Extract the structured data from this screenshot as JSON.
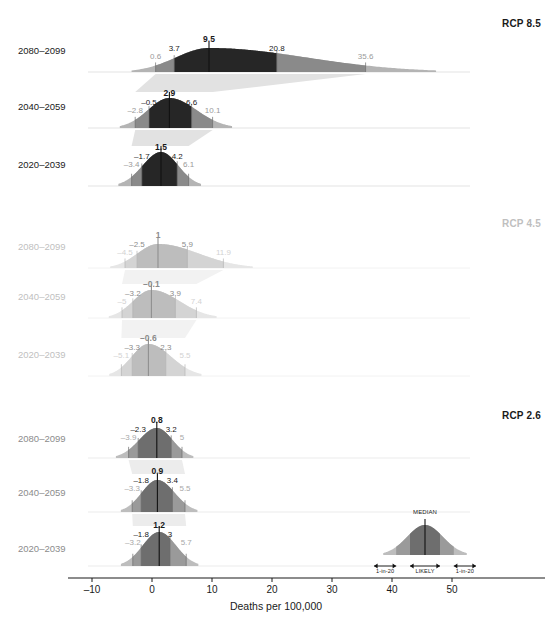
{
  "chart_data": {
    "type": "area",
    "title": "",
    "xlabel": "Deaths per 100,000",
    "ylabel": "",
    "xlim": [
      -13,
      55
    ],
    "xticks": [
      -10,
      0,
      10,
      20,
      30,
      40,
      50
    ],
    "xticklabels": [
      "–10",
      "0",
      "10",
      "20",
      "30",
      "40",
      "50"
    ],
    "grid": false,
    "legend_position": "bottom-right",
    "quantile_names": [
      "1-in-20 low",
      "likely low",
      "median",
      "likely high",
      "1-in-20 high"
    ],
    "panels": [
      {
        "name": "RCP 8.5",
        "emphasis": "dark",
        "color": "#262626",
        "rows": [
          {
            "period": "2080–2099",
            "values": [
              0.6,
              3.7,
              9.5,
              20.8,
              35.6
            ],
            "labels": [
              "0.6",
              "3.7",
              "9.5",
              "20.8",
              "35.6"
            ]
          },
          {
            "period": "2040–2059",
            "values": [
              -2.8,
              -0.5,
              2.9,
              6.6,
              10.1
            ],
            "labels": [
              "–2.8",
              "–0.5",
              "2.9",
              "6.6",
              "10.1"
            ]
          },
          {
            "period": "2020–2039",
            "values": [
              -3.4,
              -1.7,
              1.5,
              4.2,
              6.1
            ],
            "labels": [
              "–3.4",
              "–1.7",
              "1.5",
              "4.2",
              "6.1"
            ]
          }
        ]
      },
      {
        "name": "RCP 4.5",
        "emphasis": "faded",
        "color": "#c8c8c8",
        "rows": [
          {
            "period": "2080–2099",
            "values": [
              -4.5,
              -2.5,
              1.0,
              5.9,
              11.9
            ],
            "labels": [
              "–4.5",
              "–2.5",
              "1",
              "5.9",
              "11.9"
            ]
          },
          {
            "period": "2040–2059",
            "values": [
              -5.0,
              -3.2,
              -0.1,
              3.9,
              7.4
            ],
            "labels": [
              "–5",
              "–3.2",
              "–0.1",
              "3.9",
              "7.4"
            ]
          },
          {
            "period": "2020–2039",
            "values": [
              -5.1,
              -3.3,
              -0.6,
              2.3,
              5.5
            ],
            "labels": [
              "–5.1",
              "–3.3",
              "–0.6",
              "2.3",
              "5.5"
            ]
          }
        ]
      },
      {
        "name": "RCP 2.6",
        "emphasis": "medium",
        "color": "#6e6e6e",
        "rows": [
          {
            "period": "2080–2099",
            "values": [
              -3.9,
              -2.3,
              0.8,
              3.2,
              5.0
            ],
            "labels": [
              "–3.9",
              "–2.3",
              "0.8",
              "3.2",
              "5"
            ]
          },
          {
            "period": "2040–2059",
            "values": [
              -3.3,
              -1.8,
              0.9,
              3.4,
              5.5
            ],
            "labels": [
              "–3.3",
              "–1.8",
              "0.9",
              "3.4",
              "5.5"
            ]
          },
          {
            "period": "2020–2039",
            "values": [
              -3.2,
              -1.8,
              1.2,
              3.0,
              5.7
            ],
            "labels": [
              "–3.2",
              "–1.8",
              "1.2",
              "3",
              "5.7"
            ]
          }
        ]
      }
    ],
    "legend": {
      "median_label": "MEDIAN",
      "likely_label": "LIKELY",
      "low_tail_label": "1-in-20",
      "high_tail_label": "1-in-20",
      "center": 45.5,
      "likely_low": 43.0,
      "likely_high": 48.0,
      "tail_low": 40.7,
      "tail_high": 50.3,
      "span_low": 37.0,
      "span_high": 54.0
    }
  },
  "colors": {
    "dark": "#262626",
    "medium_dark": "#8a8a8a",
    "tail_dark": "#b4b4b4",
    "funnel_dark": "#e2e2e2",
    "faded_core": "#bdbdbd",
    "faded_mid": "#d4d4d4",
    "faded_tail": "#e6e6e6",
    "faded_funnel": "#f2f2f2",
    "medium_core": "#6e6e6e",
    "medium_mid": "#9a9a9a",
    "medium_tail": "#bdbdbd",
    "medium_funnel": "#ececec",
    "axis": "#1a1a1a",
    "text_dark": "#1a1a1a",
    "text_faded": "#bfbfbf",
    "text_medium": "#8c8c8c",
    "baseline": "#d0d0d0"
  }
}
